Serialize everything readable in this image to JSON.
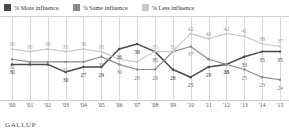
{
  "legend": {
    "items": [
      {
        "label": "% More influence",
        "color": "#4a4a4a",
        "key": "more"
      },
      {
        "label": "% Same influence",
        "color": "#8c8c8c",
        "key": "same"
      },
      {
        "label": "% Less influence",
        "color": "#c9c9c9",
        "key": "less"
      }
    ]
  },
  "footer": {
    "brand": "GALLUP"
  },
  "chart_data": {
    "type": "line",
    "title": "",
    "subtitle": "",
    "xlabel": "",
    "ylabel": "",
    "grid": true,
    "legend_position": "top-left",
    "ylim": [
      20,
      45
    ],
    "categories": [
      "'00",
      "'01",
      "'02",
      "'03",
      "'04",
      "'05",
      "'06",
      "'07",
      "'08",
      "'09",
      "'10",
      "'11",
      "'12",
      "'13",
      "'14",
      "'15"
    ],
    "x": [
      2000,
      2001,
      2002,
      2003,
      2004,
      2005,
      2006,
      2007,
      2008,
      2009,
      2010,
      2011,
      2012,
      2013,
      2014,
      2015
    ],
    "series": [
      {
        "name": "% More influence",
        "color": "#4a4a4a",
        "values": [
          30,
          30,
          30,
          27,
          29,
          29,
          36,
          38,
          35,
          28,
          25,
          29,
          30,
          33,
          35,
          35
        ]
      },
      {
        "name": "% Same influence",
        "color": "#8c8c8c",
        "values": [
          32,
          31,
          31,
          31,
          31,
          33,
          30,
          28,
          28,
          35,
          37,
          32,
          30,
          28,
          25,
          24
        ]
      },
      {
        "name": "% Less influence",
        "color": "#c9c9c9",
        "values": [
          36,
          35,
          36,
          35,
          36,
          35,
          32,
          31,
          35,
          35,
          42,
          40,
          42,
          41,
          38,
          37
        ]
      }
    ],
    "point_labels": {
      "less": [
        {
          "x": 0,
          "value": "36"
        },
        {
          "x": 1,
          "value": "35"
        },
        {
          "x": 2,
          "value": "36"
        },
        {
          "x": 3,
          "value": "35"
        },
        {
          "x": 4,
          "value": "36"
        },
        {
          "x": 5,
          "value": "35"
        },
        {
          "x": 8,
          "value": "35"
        },
        {
          "x": 9,
          "value": "35"
        },
        {
          "x": 10,
          "value": "42"
        },
        {
          "x": 11,
          "value": "40"
        },
        {
          "x": 12,
          "value": "42"
        },
        {
          "x": 13,
          "value": "41"
        },
        {
          "x": 14,
          "value": "38"
        },
        {
          "x": 15,
          "value": "37"
        }
      ],
      "same": [
        {
          "x": 0,
          "value": "32"
        },
        {
          "x": 3,
          "value": "31"
        },
        {
          "x": 5,
          "value": "33"
        },
        {
          "x": 6,
          "value": "30"
        },
        {
          "x": 7,
          "value": "28"
        },
        {
          "x": 8,
          "value": "28"
        },
        {
          "x": 10,
          "value": "37"
        },
        {
          "x": 12,
          "value": "25"
        },
        {
          "x": 13,
          "value": "25"
        },
        {
          "x": 14,
          "value": "23"
        },
        {
          "x": 15,
          "value": "24"
        }
      ],
      "more": [
        {
          "x": 0,
          "value": "30"
        },
        {
          "x": 3,
          "value": "30"
        },
        {
          "x": 4,
          "value": "27"
        },
        {
          "x": 5,
          "value": "29"
        },
        {
          "x": 6,
          "value": "36"
        },
        {
          "x": 7,
          "value": "38"
        },
        {
          "x": 8,
          "value": "35"
        },
        {
          "x": 9,
          "value": "28"
        },
        {
          "x": 10,
          "value": "25"
        },
        {
          "x": 11,
          "value": "29"
        },
        {
          "x": 12,
          "value": "30"
        },
        {
          "x": 13,
          "value": "33"
        },
        {
          "x": 14,
          "value": "35"
        },
        {
          "x": 15,
          "value": "35"
        }
      ]
    }
  }
}
